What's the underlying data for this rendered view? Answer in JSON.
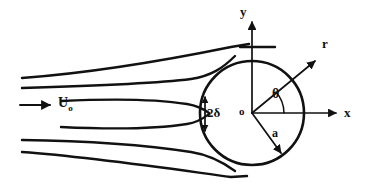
{
  "figure": {
    "type": "fluid-flow-diagram",
    "background_color": "#ffffff",
    "stroke_color": "#111111",
    "width": 367,
    "height": 186
  },
  "labels": {
    "y_axis": "y",
    "x_axis": "x",
    "radial_axis": "r",
    "angle": "θ",
    "origin": "o",
    "radius": "a",
    "boundary_layer": "2δ",
    "freestream_symbol": "U",
    "freestream_subscript": "o"
  },
  "geometry": {
    "circle": {
      "cx": 252,
      "cy": 113,
      "r": 52
    },
    "origin": {
      "x": 252,
      "y": 113
    },
    "x_axis": {
      "x1": 252,
      "y1": 113,
      "x2": 340,
      "y2": 113
    },
    "y_axis": {
      "x1": 252,
      "y1": 113,
      "x2": 252,
      "y2": 18
    },
    "r_vector": {
      "x1": 252,
      "y1": 113,
      "x2": 318,
      "y2": 58
    },
    "a_vector": {
      "x1": 252,
      "y1": 113,
      "x2": 283,
      "y2": 156
    },
    "theta_arc_radius": 30,
    "theta_degrees": 40,
    "delta_marker": {
      "x": 205,
      "y_top": 97,
      "y_bottom": 131
    },
    "inlet_arrow": {
      "x1": 20,
      "y1": 105,
      "x2": 52,
      "y2": 105
    },
    "tangent_mark": {
      "x1": 240,
      "y1": 47,
      "x2": 274,
      "y2": 47
    }
  },
  "streamlines": [
    {
      "name": "upper-outer",
      "path": "M 22,78 C 90,74 170,60 230,47 L 248,44"
    },
    {
      "name": "upper-inner",
      "path": "M 22,88 C 90,86 150,84 190,80 C 210,78 222,70 234,58"
    },
    {
      "name": "wake-upper",
      "path": "M 62,101 C 120,99 160,100 186,104 C 198,106 204,110 208,113"
    },
    {
      "name": "wake-lower",
      "path": "M 62,127 C 120,129 160,128 186,124 C 198,121 204,117 208,114"
    },
    {
      "name": "lower-inner",
      "path": "M 22,140 C 90,141 150,145 190,151 C 210,154 224,162 234,170"
    },
    {
      "name": "lower-outer",
      "path": "M 22,152 C 90,156 170,168 230,177 L 246,176"
    }
  ],
  "counts": {
    "streamlines": 6,
    "axes": 3,
    "labels": 8
  }
}
